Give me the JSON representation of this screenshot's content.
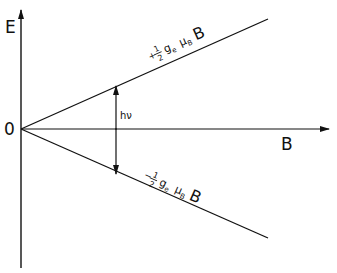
{
  "diagram": {
    "type": "zeeman-splitting",
    "axes": {
      "y_label": "E",
      "x_label": "B",
      "origin_label": "0"
    },
    "levels": [
      {
        "name": "upper",
        "prefix": "+",
        "fraction_num": "1",
        "fraction_den": "2",
        "g": "g",
        "g_sub": "e",
        "mu": "μ",
        "mu_sub": "B",
        "field": "B"
      },
      {
        "name": "lower",
        "prefix": "−",
        "fraction_num": "1",
        "fraction_den": "2",
        "g": "g",
        "g_sub": "e",
        "mu": "μ",
        "mu_sub": "B",
        "field": "B"
      }
    ],
    "transition_label": "hν",
    "colors": {
      "line": "#111111",
      "background": "#ffffff"
    }
  }
}
